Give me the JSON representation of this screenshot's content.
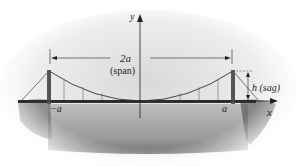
{
  "diagram": {
    "axes": {
      "x_label": "x",
      "y_label": "y"
    },
    "labels": {
      "span_value": "2a",
      "span_caption": "(span)",
      "sag": "h (sag)",
      "neg_a": "−a",
      "pos_a": "a"
    },
    "colors": {
      "ink": "#222222",
      "tower": "#555555",
      "deck": "#333333",
      "water": "#9a9a9a",
      "sky": "#e6e6e6"
    }
  }
}
